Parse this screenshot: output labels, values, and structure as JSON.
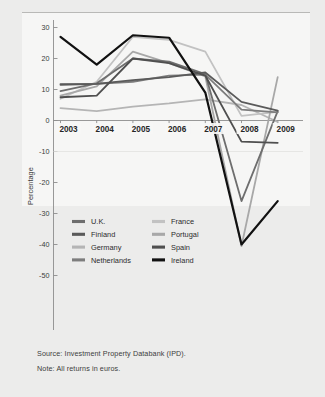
{
  "figure": {
    "background": "#ececeb",
    "plot_background": "#f6f6f5"
  },
  "axis": {
    "ylabel": "Percentage",
    "yticks": [
      "30",
      "20",
      "10",
      "0",
      "-10",
      "-20",
      "-30",
      "-40",
      "-50"
    ],
    "xticks": [
      "2003",
      "2004",
      "2005",
      "2006",
      "2007",
      "2008",
      "2009"
    ]
  },
  "legend": {
    "column1": [
      {
        "label": "U.K.",
        "color": "#6e6e6e"
      },
      {
        "label": "Finland",
        "color": "#5a5a5a"
      },
      {
        "label": "Germany",
        "color": "#b5b5b5"
      },
      {
        "label": "Netherlands",
        "color": "#7d7d7d"
      }
    ],
    "column2": [
      {
        "label": "France",
        "color": "#c2c2c2"
      },
      {
        "label": "Portugal",
        "color": "#a8a8a8"
      },
      {
        "label": "Spain",
        "color": "#4f4f4f"
      },
      {
        "label": "Ireland",
        "color": "#111111"
      }
    ]
  },
  "footnotes": {
    "source": "Source: Investment Property Databank (IPD).",
    "note": "Note: All returns in euros."
  },
  "chart_data": {
    "type": "line",
    "title": "",
    "xlabel": "",
    "ylabel": "Percentage",
    "x": [
      "2003",
      "2004",
      "2005",
      "2006",
      "2007",
      "2008",
      "2009"
    ],
    "ylim": [
      -50,
      30
    ],
    "ytick_step": 10,
    "grid": false,
    "legend_position": "below-plot-two-columns",
    "series": [
      {
        "name": "U.K.",
        "color": "#6e6e6e",
        "width": 1.8,
        "values": [
          9.5,
          12.0,
          20.0,
          19.0,
          15.0,
          -26.0,
          3.0
        ]
      },
      {
        "name": "Finland",
        "color": "#5a5a5a",
        "width": 1.8,
        "values": [
          11.5,
          11.8,
          13.0,
          14.0,
          15.5,
          6.0,
          3.2
        ]
      },
      {
        "name": "Germany",
        "color": "#b5b5b5",
        "width": 1.8,
        "values": [
          4.0,
          3.0,
          4.5,
          5.5,
          6.8,
          5.0,
          -0.5
        ]
      },
      {
        "name": "Netherlands",
        "color": "#7d7d7d",
        "width": 1.8,
        "values": [
          11.8,
          11.8,
          12.5,
          14.5,
          14.8,
          3.5,
          2.6
        ]
      },
      {
        "name": "France",
        "color": "#c2c2c2",
        "width": 1.8,
        "values": [
          7.0,
          12.5,
          27.0,
          26.0,
          22.2,
          1.5,
          2.8
        ]
      },
      {
        "name": "Portugal",
        "color": "#a8a8a8",
        "width": 1.8,
        "values": [
          8.0,
          11.0,
          22.2,
          18.5,
          14.2,
          -40.5,
          14.0
        ]
      },
      {
        "name": "Spain",
        "color": "#4f4f4f",
        "width": 1.8,
        "values": [
          7.5,
          8.0,
          20.0,
          18.5,
          14.5,
          -6.8,
          -7.2
        ]
      },
      {
        "name": "Ireland",
        "color": "#111111",
        "width": 2.2,
        "values": [
          27.0,
          18.0,
          27.5,
          26.7,
          9.0,
          -40.0,
          -26.0
        ]
      }
    ]
  }
}
